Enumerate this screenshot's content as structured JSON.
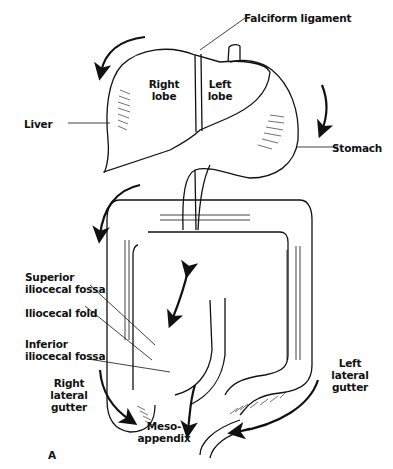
{
  "figure": {
    "panel_letter": "A",
    "labels": {
      "falciform": "Falciform ligament",
      "right_lobe_1": "Right",
      "right_lobe_2": "lobe",
      "left_lobe_1": "Left",
      "left_lobe_2": "lobe",
      "liver": "Liver",
      "stomach": "Stomach",
      "sup_fossa_1": "Superior",
      "sup_fossa_2": "iliocecal fossa",
      "ilio_fold": "Iliocecal fold",
      "inf_fossa_1": "Inferior",
      "inf_fossa_2": "iliocecal fossa",
      "right_gutter_1": "Right",
      "right_gutter_2": "lateral gutter",
      "meso_1": "Meso-",
      "meso_2": "appendix",
      "left_gutter_1": "Left lateral",
      "left_gutter_2": "gutter"
    },
    "colors": {
      "ink": "#111111",
      "background": "#ffffff"
    }
  }
}
